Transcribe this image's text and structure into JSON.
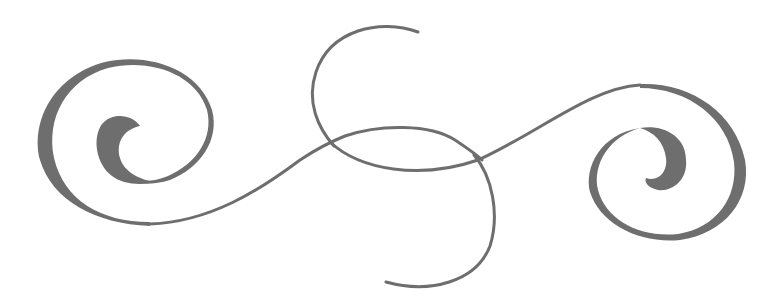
{
  "ornament": {
    "title": "Decorative swirl flourish divider",
    "colors": {
      "background": "#ffffff",
      "ink": "#6e6e6e"
    },
    "parts": [
      {
        "name": "left-spiral",
        "description": "Outer swirl loop with thick inner curl hook"
      },
      {
        "name": "center-loop",
        "description": "Interlaced S-shaped loop crossing the baseline twice"
      },
      {
        "name": "connecting-flourish",
        "description": "Sweeping baseline joining both spirals"
      },
      {
        "name": "right-spiral",
        "description": "Mirrored outer swirl loop with thick inner curl hook"
      }
    ]
  }
}
